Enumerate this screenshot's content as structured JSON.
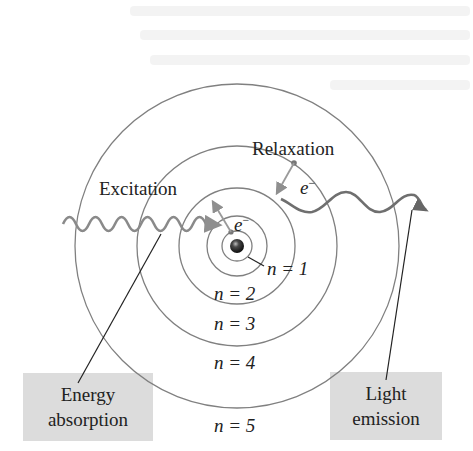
{
  "diagram": {
    "type": "bohr-model-excitation-relaxation",
    "center": [
      237,
      246
    ],
    "orbits": [
      {
        "n": 1,
        "label": "n = 1",
        "radius": 15
      },
      {
        "n": 2,
        "label": "n = 2",
        "radius": 30
      },
      {
        "n": 3,
        "label": "n = 3",
        "radius": 58
      },
      {
        "n": 4,
        "label": "n = 4",
        "radius": 100
      },
      {
        "n": 5,
        "label": "n = 5",
        "radius": 162
      }
    ],
    "labels": {
      "excitation": "Excitation",
      "relaxation": "Relaxation",
      "electron_excitation": "e",
      "electron_relaxation": "e",
      "electron_superscript": "−",
      "n1": "n = 1",
      "n2": "n = 2",
      "n3": "n = 3",
      "n4": "n = 4",
      "n5": "n = 5"
    },
    "callouts": {
      "energy_absorption": {
        "line1": "Energy",
        "line2": "absorption"
      },
      "light_emission": {
        "line1": "Light",
        "line2": "emission"
      }
    },
    "colors": {
      "orbit": "#808080",
      "wave": "#7a7a7a",
      "arrow": "#9a9a9a",
      "nucleus": "#1a1a1a",
      "callout_bg": "#dcdcdc",
      "text": "#222222"
    }
  }
}
